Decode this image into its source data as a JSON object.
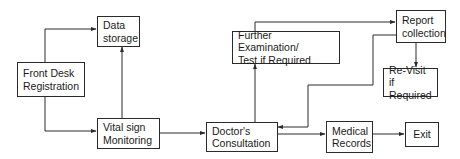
{
  "diagram": {
    "type": "flowchart",
    "title": "",
    "nodes": [
      {
        "id": "front_desk",
        "label": "Front Desk\nRegistration"
      },
      {
        "id": "data_storage",
        "label": "Data\nstorage"
      },
      {
        "id": "vital_sign",
        "label": "Vital sign\nMonitoring"
      },
      {
        "id": "doctor",
        "label": "Doctor's\nConsultation"
      },
      {
        "id": "further_exam",
        "label": "Further Examination/\nTest if Required"
      },
      {
        "id": "report",
        "label": "Report\ncollection"
      },
      {
        "id": "revisit",
        "label": "Re-Visit if\nRequired"
      },
      {
        "id": "medical_records",
        "label": "Medical\nRecords"
      },
      {
        "id": "exit",
        "label": "Exit"
      }
    ],
    "edges": [
      {
        "from": "front_desk",
        "to": "data_storage"
      },
      {
        "from": "front_desk",
        "to": "vital_sign"
      },
      {
        "from": "vital_sign",
        "to": "data_storage"
      },
      {
        "from": "vital_sign",
        "to": "doctor"
      },
      {
        "from": "doctor",
        "to": "further_exam"
      },
      {
        "from": "further_exam",
        "to": "report"
      },
      {
        "from": "report",
        "to": "revisit"
      },
      {
        "from": "report",
        "to": "doctor"
      },
      {
        "from": "doctor",
        "to": "medical_records"
      },
      {
        "from": "medical_records",
        "to": "exit"
      }
    ],
    "colors": {
      "line": "#2a2a2a",
      "box_border": "#2a2a2a",
      "background": "#ffffff"
    }
  }
}
